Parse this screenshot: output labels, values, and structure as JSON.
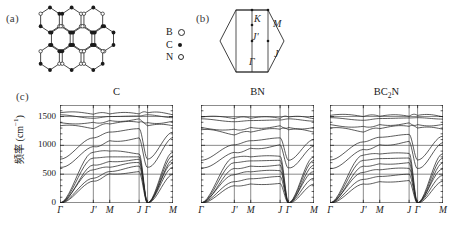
{
  "figure": {
    "panels": {
      "a": {
        "label": "(a)",
        "name": "bc2n-lattice-structure"
      },
      "b": {
        "label": "(b)",
        "name": "brillouin-zone"
      },
      "c": {
        "label": "(c)",
        "name": "phonon-dispersion-panels"
      }
    },
    "legend": [
      {
        "species": "B",
        "marker": "open-circle-large"
      },
      {
        "species": "C",
        "marker": "filled-circle"
      },
      {
        "species": "N",
        "marker": "open-circle-small"
      }
    ],
    "brillouin_zone": {
      "points": [
        {
          "label": "K",
          "x": 38,
          "y": 9
        },
        {
          "label": "M",
          "x": 57,
          "y": 14
        },
        {
          "label": "J'",
          "x": 36,
          "y": 27
        },
        {
          "label": "J",
          "x": 58,
          "y": 44
        },
        {
          "label": "Γ",
          "x": 33,
          "y": 52
        }
      ]
    }
  },
  "chart_data": [
    {
      "type": "line",
      "title": "C",
      "xlabel": "",
      "ylabel": "频率 (cm⁻¹)",
      "ylim": [
        0,
        1700
      ],
      "yticks": [
        0,
        500,
        1000,
        1500
      ],
      "ytick_labels": [
        "0",
        "500",
        "1000",
        "1500"
      ],
      "xticks": [
        0,
        1,
        2,
        3,
        4,
        5
      ],
      "xtick_labels": [
        "Γ",
        "J'",
        "M",
        "J",
        "Γ",
        "M"
      ],
      "grid": true,
      "series": [
        {
          "name": "branch-1",
          "values": [
            0,
            380,
            505,
            545,
            0,
            500
          ]
        },
        {
          "name": "branch-2",
          "values": [
            0,
            430,
            545,
            640,
            0,
            620
          ]
        },
        {
          "name": "branch-3",
          "values": [
            0,
            575,
            620,
            700,
            0,
            690
          ]
        },
        {
          "name": "branch-4",
          "values": [
            0,
            660,
            720,
            760,
            0,
            755
          ]
        },
        {
          "name": "branch-5",
          "values": [
            0,
            780,
            800,
            800,
            0,
            820
          ]
        },
        {
          "name": "branch-6",
          "values": [
            0,
            880,
            900,
            850,
            0,
            880
          ]
        },
        {
          "name": "branch-7",
          "values": [
            620,
            980,
            1080,
            1130,
            620,
            1140
          ]
        },
        {
          "name": "branch-8",
          "values": [
            760,
            1130,
            1230,
            1290,
            760,
            1230
          ]
        },
        {
          "name": "branch-9",
          "values": [
            1340,
            1290,
            1370,
            1400,
            1340,
            1340
          ]
        },
        {
          "name": "branch-10",
          "values": [
            1395,
            1400,
            1430,
            1460,
            1395,
            1420
          ]
        },
        {
          "name": "branch-11",
          "values": [
            1530,
            1470,
            1500,
            1510,
            1530,
            1480
          ]
        },
        {
          "name": "branch-12",
          "values": [
            1565,
            1540,
            1545,
            1545,
            1565,
            1530
          ]
        }
      ]
    },
    {
      "type": "line",
      "title": "BN",
      "xlabel": "",
      "ylabel": "",
      "ylim": [
        0,
        1700
      ],
      "yticks": [
        0,
        500,
        1000,
        1500
      ],
      "ytick_labels": [
        "",
        "",
        "",
        ""
      ],
      "xticks": [
        0,
        1,
        2,
        3,
        4,
        5
      ],
      "xtick_labels": [
        "Γ",
        "J'",
        "M",
        "J",
        "Γ",
        "M"
      ],
      "grid": true,
      "series": [
        {
          "name": "branch-1",
          "values": [
            0,
            300,
            330,
            340,
            0,
            330
          ]
        },
        {
          "name": "branch-2",
          "values": [
            0,
            370,
            420,
            460,
            0,
            430
          ]
        },
        {
          "name": "branch-3",
          "values": [
            0,
            490,
            540,
            560,
            0,
            545
          ]
        },
        {
          "name": "branch-4",
          "values": [
            0,
            600,
            640,
            660,
            0,
            660
          ]
        },
        {
          "name": "branch-5",
          "values": [
            0,
            700,
            730,
            740,
            0,
            740
          ]
        },
        {
          "name": "branch-6",
          "values": [
            0,
            790,
            800,
            810,
            0,
            800
          ]
        },
        {
          "name": "branch-7",
          "values": [
            610,
            880,
            950,
            1010,
            610,
            990
          ]
        },
        {
          "name": "branch-8",
          "values": [
            740,
            1010,
            1080,
            1130,
            740,
            1100
          ]
        },
        {
          "name": "branch-9",
          "values": [
            1270,
            1180,
            1230,
            1280,
            1270,
            1230
          ]
        },
        {
          "name": "branch-10",
          "values": [
            1310,
            1280,
            1310,
            1340,
            1310,
            1310
          ]
        },
        {
          "name": "branch-11",
          "values": [
            1460,
            1410,
            1430,
            1440,
            1460,
            1420
          ]
        },
        {
          "name": "branch-12",
          "values": [
            1490,
            1465,
            1470,
            1470,
            1490,
            1460
          ]
        }
      ]
    },
    {
      "type": "line",
      "title": "BC2N",
      "title_html": "BC<sub>2</sub>N",
      "xlabel": "",
      "ylabel": "",
      "ylim": [
        0,
        1700
      ],
      "yticks": [
        0,
        500,
        1000,
        1500
      ],
      "ytick_labels": [
        "",
        "",
        "",
        ""
      ],
      "xticks": [
        0,
        1,
        2,
        3,
        4,
        5
      ],
      "xtick_labels": [
        "Γ",
        "J'",
        "M",
        "J",
        "Γ",
        "M"
      ],
      "grid": true,
      "series": [
        {
          "name": "branch-1",
          "values": [
            0,
            330,
            370,
            390,
            0,
            380
          ]
        },
        {
          "name": "branch-2",
          "values": [
            0,
            410,
            460,
            500,
            0,
            480
          ]
        },
        {
          "name": "branch-3",
          "values": [
            0,
            530,
            575,
            600,
            0,
            590
          ]
        },
        {
          "name": "branch-4",
          "values": [
            0,
            640,
            680,
            700,
            0,
            700
          ]
        },
        {
          "name": "branch-5",
          "values": [
            0,
            740,
            770,
            780,
            0,
            780
          ]
        },
        {
          "name": "branch-6",
          "values": [
            0,
            830,
            850,
            860,
            0,
            855
          ]
        },
        {
          "name": "branch-7",
          "values": [
            600,
            930,
            1010,
            1070,
            600,
            1050
          ]
        },
        {
          "name": "branch-8",
          "values": [
            745,
            1060,
            1140,
            1190,
            745,
            1160
          ]
        },
        {
          "name": "branch-9",
          "values": [
            1300,
            1230,
            1290,
            1330,
            1300,
            1280
          ]
        },
        {
          "name": "branch-10",
          "values": [
            1360,
            1330,
            1360,
            1390,
            1360,
            1365
          ]
        },
        {
          "name": "branch-11",
          "values": [
            1480,
            1435,
            1465,
            1475,
            1480,
            1455
          ]
        },
        {
          "name": "branch-12",
          "values": [
            1520,
            1500,
            1505,
            1505,
            1520,
            1495
          ]
        }
      ]
    }
  ],
  "style": {
    "line_color": "#262626",
    "axis_color": "#1a1a1a",
    "grid_color": "#3a3a3a",
    "background": "#ffffff"
  }
}
